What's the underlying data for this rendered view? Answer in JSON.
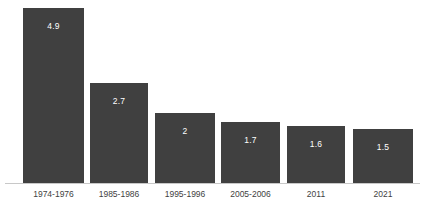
{
  "chart_data": {
    "type": "bar",
    "title": "",
    "subtitle": "",
    "xlabel": "",
    "ylabel": "",
    "categories": [
      "1974-1976",
      "1985-1986",
      "1995-1996",
      "2005-2006",
      "2011",
      "2021"
    ],
    "values": [
      4.9,
      2.7,
      2,
      1.7,
      1.6,
      1.5
    ],
    "value_labels": [
      "4.9",
      "2.7",
      "2",
      "1.7",
      "1.6",
      "1.5"
    ],
    "ylim": [
      0,
      4.9
    ],
    "grid": false,
    "legend": false,
    "legend_position": "none",
    "orientation": "vertical",
    "colors": {
      "bar_fill": "#404040",
      "value_label": "#ffffff",
      "tick_label": "#3f3f3f",
      "axis_line": "#c8c8c8",
      "background": "#ffffff"
    }
  },
  "layout": {
    "baseline_y": 184,
    "bars": [
      {
        "left": 23,
        "width": 61,
        "height": 176
      },
      {
        "left": 90,
        "width": 58,
        "height": 101
      },
      {
        "left": 155,
        "width": 60,
        "height": 71
      },
      {
        "left": 221,
        "width": 59,
        "height": 62
      },
      {
        "left": 287,
        "width": 58,
        "height": 58
      },
      {
        "left": 353,
        "width": 60,
        "height": 55
      }
    ]
  }
}
